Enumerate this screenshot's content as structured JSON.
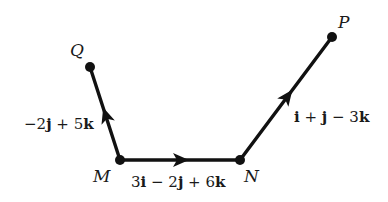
{
  "diagram": {
    "type": "vector-path",
    "points": {
      "Q": {
        "label": "Q",
        "x": 90,
        "y": 67
      },
      "M": {
        "label": "M",
        "x": 120,
        "y": 160
      },
      "N": {
        "label": "N",
        "x": 240,
        "y": 160
      },
      "P": {
        "label": "P",
        "x": 332,
        "y": 37
      }
    },
    "vectors": [
      {
        "from": "M",
        "to": "Q",
        "label": "−2j + 5k",
        "parts": [
          "−2",
          "j",
          " + 5",
          "k"
        ]
      },
      {
        "from": "M",
        "to": "N",
        "label": "3i − 2j + 6k",
        "parts": [
          "3",
          "i",
          " − 2",
          "j",
          " + 6",
          "k"
        ]
      },
      {
        "from": "N",
        "to": "P",
        "label": "i + j − 3k",
        "parts": [
          "",
          "i",
          " + ",
          "j",
          " − 3",
          "k"
        ]
      }
    ],
    "colors": {
      "stroke": "#111111",
      "background": "#ffffff"
    }
  }
}
